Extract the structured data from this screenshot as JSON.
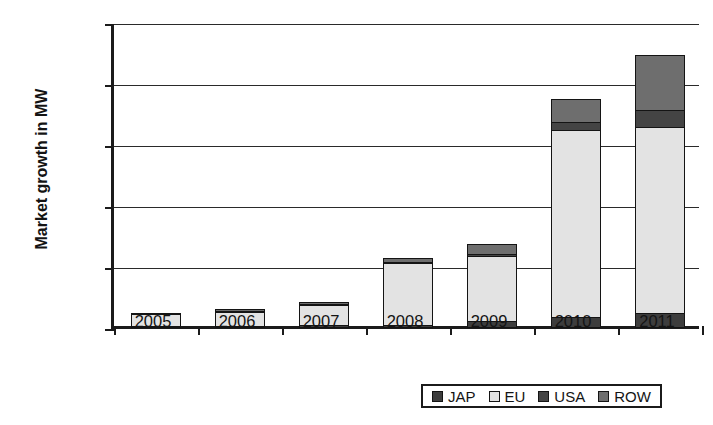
{
  "chart_data": {
    "type": "bar",
    "stacked": true,
    "title": "",
    "xlabel": "",
    "ylabel": "Market growth in MW",
    "categories": [
      "2005",
      "2006",
      "2007",
      "2008",
      "2009",
      "2010",
      "2011"
    ],
    "ylim": [
      0,
      25000
    ],
    "yticks": [
      0,
      5000,
      10000,
      15000,
      20000,
      25000
    ],
    "ytick_labels": [
      "0",
      "5000",
      "10000",
      "15000",
      "20000",
      "25000"
    ],
    "grid": true,
    "legend_position": "bottom",
    "series": [
      {
        "name": "JAP",
        "color": "#3d3d3d",
        "values": [
          100,
          100,
          200,
          200,
          500,
          900,
          1200
        ]
      },
      {
        "name": "EU",
        "color": "#e3e3e3",
        "values": [
          1100,
          1200,
          1800,
          5200,
          5500,
          15400,
          15400
        ]
      },
      {
        "name": "USA",
        "color": "#444444",
        "values": [
          150,
          200,
          200,
          200,
          250,
          800,
          1500
        ]
      },
      {
        "name": "ROW",
        "color": "#6e6e6e",
        "values": [
          150,
          300,
          300,
          500,
          950,
          2000,
          4600
        ]
      }
    ],
    "totals": [
      1500,
      1800,
      2500,
      6100,
      7200,
      19100,
      22700
    ]
  },
  "legend": {
    "items": [
      {
        "label": "JAP",
        "swatch": "swatch-jap"
      },
      {
        "label": "EU",
        "swatch": "swatch-eu"
      },
      {
        "label": "USA",
        "swatch": "swatch-usa"
      },
      {
        "label": "ROW",
        "swatch": "swatch-row"
      }
    ]
  }
}
